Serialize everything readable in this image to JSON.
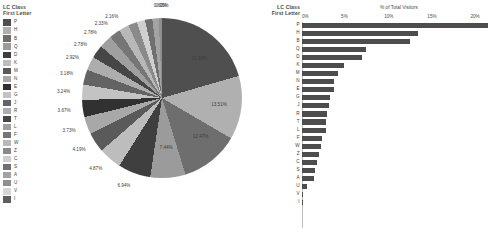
{
  "legend": {
    "title_line1": "LC Class",
    "title_line2": "First Letter"
  },
  "bar_panel": {
    "title_line1": "LC Class",
    "title_line2": "First Letter"
  },
  "chart_data": [
    {
      "type": "pie",
      "title": "",
      "legend_title": "LC Class First Letter",
      "legend_position": "left",
      "value_suffix": "%",
      "categories": [
        "P",
        "H",
        "B",
        "Q",
        "D",
        "K",
        "M",
        "N",
        "E",
        "G",
        "J",
        "R",
        "T",
        "L",
        "F",
        "W",
        "Z",
        "C",
        "S",
        "A",
        "U",
        "V",
        "I"
      ],
      "values": [
        21.58,
        13.51,
        12.47,
        7.44,
        6.94,
        4.87,
        4.19,
        3.73,
        3.67,
        3.24,
        3.18,
        2.92,
        2.78,
        2.78,
        2.33,
        2.16,
        1.92,
        1.74,
        1.55,
        1.38,
        0.6,
        0.05,
        0.03
      ],
      "labels": [
        "21.58%",
        "13.51%",
        "12.47%",
        "7.44%",
        "6.94%",
        "4.87%",
        "4.19%",
        "3.73%",
        "3.67%",
        "3.24%",
        "3.18%",
        "2.92%",
        "2.78%",
        "2.78%",
        "2.33%",
        "2.16%",
        "",
        "",
        "",
        "",
        "0.60%",
        "0.05%",
        ""
      ],
      "colors": [
        "#4f4f4f",
        "#b0b0b0",
        "#6e6e6e",
        "#9b9b9b",
        "#3f3f3f",
        "#bdbdbd",
        "#5a5a5a",
        "#a8a8a8",
        "#313131",
        "#c3c3c3",
        "#636363",
        "#adadad",
        "#464646",
        "#9f9f9f",
        "#767676",
        "#b8b8b8",
        "#8a8a8a",
        "#cfcfcf",
        "#707070",
        "#a3a3a3",
        "#8f8f8f",
        "#d6d6d6",
        "#5e5e5e"
      ]
    },
    {
      "type": "bar",
      "orientation": "horizontal",
      "title": "",
      "xlabel": "% of Total Visitors",
      "ylabel": "LC Class First Letter",
      "xlim": [
        0,
        22.5
      ],
      "grid": false,
      "bar_color": "#4d4d4d",
      "xticks": [
        "0%",
        "5%",
        "10%",
        "15%",
        "20%"
      ],
      "xtick_values": [
        0,
        5,
        10,
        15,
        20
      ],
      "categories": [
        "P",
        "H",
        "B",
        "Q",
        "D",
        "K",
        "M",
        "N",
        "E",
        "G",
        "J",
        "R",
        "T",
        "L",
        "F",
        "W",
        "Z",
        "C",
        "S",
        "A",
        "U",
        "V",
        "I"
      ],
      "values": [
        21.58,
        13.51,
        12.47,
        7.44,
        6.94,
        4.87,
        4.19,
        3.73,
        3.67,
        3.24,
        3.18,
        2.92,
        2.78,
        2.78,
        2.33,
        2.16,
        1.92,
        1.74,
        1.55,
        1.38,
        0.6,
        0.05,
        0.03
      ]
    }
  ]
}
